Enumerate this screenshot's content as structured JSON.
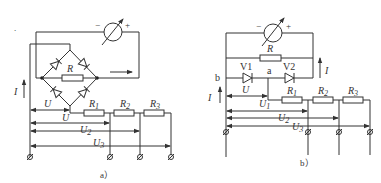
{
  "figure_a": {
    "caption": "a）",
    "meter": {
      "minus": "−",
      "plus": "+"
    },
    "resistor_R": "R",
    "current": "I",
    "labels": {
      "U": "U",
      "U1": "U",
      "U1_sub": "1",
      "U2": "U",
      "U2_sub": "2",
      "U3": "U",
      "U3_sub": "3"
    },
    "resistors": [
      {
        "name": "R",
        "sub": "1"
      },
      {
        "name": "R",
        "sub": "2"
      },
      {
        "name": "R",
        "sub": "3"
      }
    ]
  },
  "figure_b": {
    "caption": "b）",
    "meter": {
      "minus": "−",
      "plus": "+"
    },
    "resistor_R": "R",
    "current_left": "I",
    "current_right": "I",
    "diodes": {
      "v1": "V1",
      "v2": "V2"
    },
    "nodes": {
      "a": "a",
      "b": "b"
    },
    "labels": {
      "U": "U",
      "U1": "U",
      "U1_sub": "1",
      "U2": "U",
      "U2_sub": "2",
      "U3": "U",
      "U3_sub": "3"
    },
    "resistors": [
      {
        "name": "R",
        "sub": "1"
      },
      {
        "name": "R",
        "sub": "2"
      },
      {
        "name": "R",
        "sub": "3"
      }
    ]
  },
  "stray_dot": "."
}
